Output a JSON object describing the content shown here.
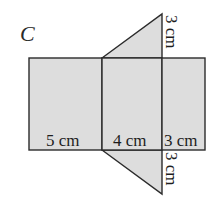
{
  "figure": {
    "label": "C",
    "fill_color": "#dddddd",
    "stroke_color": "#2b2b2b"
  },
  "rectangles": [
    {
      "name": "face-5cm",
      "label": "5 cm"
    },
    {
      "name": "face-4cm",
      "label": "4 cm"
    },
    {
      "name": "face-3cm",
      "label": "3 cm"
    }
  ],
  "triangles": [
    {
      "name": "top-triangle",
      "label": "3 cm"
    },
    {
      "name": "bottom-triangle",
      "label": "3 cm"
    }
  ]
}
